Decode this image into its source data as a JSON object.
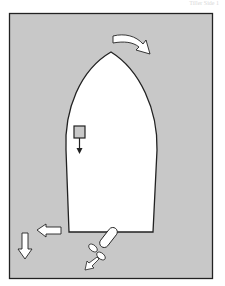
{
  "header": {
    "text": "Tiller Side 1"
  },
  "diagram": {
    "colors": {
      "water": "#c8c8c8",
      "hull": "#ffffff",
      "outline": "#222222",
      "arrow_fill": "#ffffff"
    },
    "elements": [
      {
        "name": "hull",
        "description": "Boat hull seen from above, bow pointing up"
      },
      {
        "name": "bow-swing-arrow",
        "description": "Curved arrow at bow indicating turn to starboard"
      },
      {
        "name": "helm-position",
        "description": "Small square with downward arrow (helm / pivot)"
      },
      {
        "name": "stern-sideways-arrow",
        "description": "Arrow pointing left at stern"
      },
      {
        "name": "astern-arrow",
        "description": "Arrow pointing down indicating reverse motion"
      },
      {
        "name": "propeller-rudder",
        "description": "Propeller and rudder with thrust arrow"
      }
    ]
  }
}
